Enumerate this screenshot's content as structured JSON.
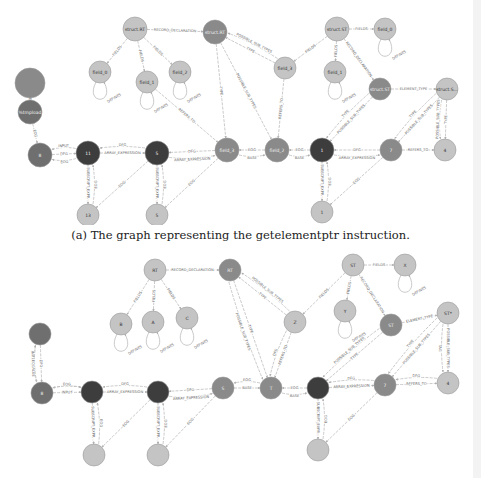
{
  "caption_a": "(a) The graph representing the getelementptr instruction.",
  "colors": {
    "dark": "#3d3d3d",
    "medium": "#8a8a8a",
    "light": "#c4c4c4",
    "mediumdark": "#6f6f6f",
    "edge": "#bdbdbd"
  },
  "graph_a": {
    "nodes": [
      {
        "id": "a_top",
        "label": "",
        "x": 30,
        "y": 83,
        "r": 15,
        "tone": "medium"
      },
      {
        "id": "a_tmp",
        "label": "%tmpload",
        "x": 30,
        "y": 112,
        "r": 12,
        "tone": "mediumdark"
      },
      {
        "id": "a_8",
        "label": "8",
        "x": 40,
        "y": 155,
        "r": 12,
        "tone": "mediumdark"
      },
      {
        "id": "a_11",
        "label": "11",
        "x": 88,
        "y": 153,
        "r": 12,
        "tone": "dark"
      },
      {
        "id": "a_13",
        "label": "13",
        "x": 88,
        "y": 215,
        "r": 11,
        "tone": "light"
      },
      {
        "id": "a_5",
        "label": "5",
        "x": 157,
        "y": 153,
        "r": 12,
        "tone": "dark"
      },
      {
        "id": "a_5b",
        "label": "5",
        "x": 157,
        "y": 215,
        "r": 11,
        "tone": "light"
      },
      {
        "id": "a_field3",
        "label": "field_3",
        "x": 227,
        "y": 150,
        "r": 12,
        "tone": "medium"
      },
      {
        "id": "a_field2b",
        "label": "field_2",
        "x": 277,
        "y": 150,
        "r": 12,
        "tone": "medium"
      },
      {
        "id": "a_1",
        "label": "1",
        "x": 322,
        "y": 150,
        "r": 12,
        "tone": "dark"
      },
      {
        "id": "a_1b",
        "label": "1",
        "x": 322,
        "y": 212,
        "r": 11,
        "tone": "light"
      },
      {
        "id": "a_7",
        "label": "7",
        "x": 391,
        "y": 150,
        "r": 11,
        "tone": "medium"
      },
      {
        "id": "a_4",
        "label": "4",
        "x": 445,
        "y": 150,
        "r": 11,
        "tone": "light"
      },
      {
        "id": "a_structRT",
        "label": "struct.RT",
        "x": 135,
        "y": 29,
        "r": 12,
        "tone": "light"
      },
      {
        "id": "a_structRT2",
        "label": "struct.RT",
        "x": 215,
        "y": 32,
        "r": 12,
        "tone": "medium"
      },
      {
        "id": "a_field0",
        "label": "field_0",
        "x": 100,
        "y": 72,
        "r": 11,
        "tone": "light"
      },
      {
        "id": "a_field1",
        "label": "field_1",
        "x": 147,
        "y": 82,
        "r": 11,
        "tone": "light"
      },
      {
        "id": "a_field2",
        "label": "field_2",
        "x": 180,
        "y": 72,
        "r": 11,
        "tone": "light"
      },
      {
        "id": "a_field3b",
        "label": "field_3",
        "x": 285,
        "y": 68,
        "r": 11,
        "tone": "light"
      },
      {
        "id": "a_structST",
        "label": "struct.ST",
        "x": 337,
        "y": 29,
        "r": 12,
        "tone": "light"
      },
      {
        "id": "a_field0b",
        "label": "field_0",
        "x": 385,
        "y": 29,
        "r": 11,
        "tone": "light"
      },
      {
        "id": "a_field1b",
        "label": "field_1",
        "x": 335,
        "y": 72,
        "r": 11,
        "tone": "light"
      },
      {
        "id": "a_structST2",
        "label": "struct.ST",
        "x": 380,
        "y": 89,
        "r": 11,
        "tone": "medium"
      },
      {
        "id": "a_structS",
        "label": "struct.S...",
        "x": 447,
        "y": 89,
        "r": 11,
        "tone": "light"
      }
    ],
    "edges": [
      {
        "from": "a_top",
        "to": "a_tmp",
        "label": "DEF"
      },
      {
        "from": "a_tmp",
        "to": "a_8",
        "label": "EOG"
      },
      {
        "from": "a_8",
        "to": "a_11",
        "label": "DFG"
      },
      {
        "from": "a_11",
        "to": "a_8",
        "label": "INPUT"
      },
      {
        "from": "a_11",
        "to": "a_8",
        "label": "EOG"
      },
      {
        "from": "a_11",
        "to": "a_5",
        "label": "ARRAY_EXPRESSION"
      },
      {
        "from": "a_5",
        "to": "a_11",
        "label": "DFG"
      },
      {
        "from": "a_11",
        "to": "a_13",
        "label": "SUBSCRIPT_EXPR..."
      },
      {
        "from": "a_13",
        "to": "a_11",
        "label": "EOG"
      },
      {
        "from": "a_5",
        "to": "a_13",
        "label": "EOG"
      },
      {
        "from": "a_5",
        "to": "a_5b",
        "label": "SUBSCRIPT_EXPR..."
      },
      {
        "from": "a_5b",
        "to": "a_5",
        "label": "EOG"
      },
      {
        "from": "a_field3",
        "to": "a_5",
        "label": "DFG"
      },
      {
        "from": "a_5",
        "to": "a_field3",
        "label": "ARRAY_EXPRESSION"
      },
      {
        "from": "a_field3",
        "to": "a_5b",
        "label": "EOG"
      },
      {
        "from": "a_field2b",
        "to": "a_field3",
        "label": "EOG"
      },
      {
        "from": "a_field3",
        "to": "a_field2b",
        "label": "BASE"
      },
      {
        "from": "a_1",
        "to": "a_field2b",
        "label": "EOG"
      },
      {
        "from": "a_field2b",
        "to": "a_1",
        "label": "BASE"
      },
      {
        "from": "a_1",
        "to": "a_1b",
        "label": "SUBSCRIPT_EXPR..."
      },
      {
        "from": "a_1b",
        "to": "a_1",
        "label": "EOG"
      },
      {
        "from": "a_7",
        "to": "a_1",
        "label": "DFG"
      },
      {
        "from": "a_1",
        "to": "a_7",
        "label": "ARRAY_EXPRESSION"
      },
      {
        "from": "a_7",
        "to": "a_1b",
        "label": "EOG"
      },
      {
        "from": "a_7",
        "to": "a_4",
        "label": "REFERS_TO"
      },
      {
        "from": "a_structRT",
        "to": "a_structRT2",
        "label": "RECORD_DECLARATION"
      },
      {
        "from": "a_structRT",
        "to": "a_field0",
        "label": "FIELDS"
      },
      {
        "from": "a_structRT",
        "to": "a_field1",
        "label": "FIELDS"
      },
      {
        "from": "a_structRT",
        "to": "a_field2",
        "label": "FIELDS"
      },
      {
        "from": "a_field0",
        "to": "a_field0",
        "label": "DEFINES"
      },
      {
        "from": "a_field1",
        "to": "a_field1",
        "label": "DEFINES"
      },
      {
        "from": "a_field2",
        "to": "a_field2",
        "label": "DEFINES"
      },
      {
        "from": "a_field1",
        "to": "a_field3",
        "label": "REFERS_TO"
      },
      {
        "from": "a_structRT2",
        "to": "a_field3",
        "label": "TYPE"
      },
      {
        "from": "a_field3b",
        "to": "a_structRT2",
        "label": "TYPE"
      },
      {
        "from": "a_field3b",
        "to": "a_structRT2",
        "label": "POSSIBLE_SUB_TYPES"
      },
      {
        "from": "a_structRT2",
        "to": "a_field2b",
        "label": "POSSIBLE_SUB_TYPES"
      },
      {
        "from": "a_field3b",
        "to": "a_field2b",
        "label": "REFERS_TO"
      },
      {
        "from": "a_structST",
        "to": "a_field0b",
        "label": "FIELDS"
      },
      {
        "from": "a_structST",
        "to": "a_field1b",
        "label": "FIELDS"
      },
      {
        "from": "a_structST",
        "to": "a_field3b",
        "label": "FIELDS"
      },
      {
        "from": "a_structST",
        "to": "a_structST2",
        "label": "RECORD_DECLARATION"
      },
      {
        "from": "a_field0b",
        "to": "a_field0b",
        "label": "DEFINES"
      },
      {
        "from": "a_field1b",
        "to": "a_field1b",
        "label": "DEFINES"
      },
      {
        "from": "a_structST2",
        "to": "a_structS",
        "label": "ELEMENT_TYPE"
      },
      {
        "from": "a_structST2",
        "to": "a_1",
        "label": "POSSIBLE_SUB_TYPES"
      },
      {
        "from": "a_structST2",
        "to": "a_1",
        "label": "TYPE"
      },
      {
        "from": "a_structS",
        "to": "a_7",
        "label": "POSSIBLE_SUB_TYPES"
      },
      {
        "from": "a_structS",
        "to": "a_7",
        "label": "TYPE"
      },
      {
        "from": "a_structS",
        "to": "a_4",
        "label": "TYPE"
      },
      {
        "from": "a_structS",
        "to": "a_4",
        "label": "POSSIBLE_SUB_TYPES"
      }
    ]
  },
  "graph_b": {
    "nodes": [
      {
        "id": "b_top",
        "label": "",
        "x": 40,
        "y": 334,
        "r": 11,
        "tone": "mediumdark"
      },
      {
        "id": "b_8",
        "label": "8",
        "x": 42,
        "y": 393,
        "r": 11,
        "tone": "mediumdark"
      },
      {
        "id": "b_11",
        "label": "",
        "x": 92,
        "y": 392,
        "r": 11,
        "tone": "dark"
      },
      {
        "id": "b_13",
        "label": "",
        "x": 94,
        "y": 455,
        "r": 11,
        "tone": "light"
      },
      {
        "id": "b_5",
        "label": "",
        "x": 158,
        "y": 392,
        "r": 11,
        "tone": "dark"
      },
      {
        "id": "b_5b",
        "label": "",
        "x": 158,
        "y": 455,
        "r": 11,
        "tone": "light"
      },
      {
        "id": "b_s",
        "label": "S",
        "x": 223,
        "y": 388,
        "r": 11,
        "tone": "medium"
      },
      {
        "id": "b_t",
        "label": "T",
        "x": 271,
        "y": 388,
        "r": 11,
        "tone": "medium"
      },
      {
        "id": "b_1",
        "label": "",
        "x": 318,
        "y": 388,
        "r": 11,
        "tone": "dark"
      },
      {
        "id": "b_1b",
        "label": "",
        "x": 318,
        "y": 450,
        "r": 11,
        "tone": "light"
      },
      {
        "id": "b_7",
        "label": "7",
        "x": 385,
        "y": 385,
        "r": 11,
        "tone": "medium"
      },
      {
        "id": "b_4",
        "label": "4",
        "x": 448,
        "y": 383,
        "r": 11,
        "tone": "light"
      },
      {
        "id": "b_RT",
        "label": "RT",
        "x": 155,
        "y": 270,
        "r": 11,
        "tone": "light"
      },
      {
        "id": "b_RT2",
        "label": "RT",
        "x": 230,
        "y": 270,
        "r": 11,
        "tone": "medium"
      },
      {
        "id": "b_B",
        "label": "B",
        "x": 121,
        "y": 324,
        "r": 11,
        "tone": "light"
      },
      {
        "id": "b_A",
        "label": "A",
        "x": 153,
        "y": 322,
        "r": 11,
        "tone": "light"
      },
      {
        "id": "b_C",
        "label": "C",
        "x": 187,
        "y": 318,
        "r": 11,
        "tone": "light"
      },
      {
        "id": "b_Z",
        "label": "Z",
        "x": 295,
        "y": 322,
        "r": 11,
        "tone": "light"
      },
      {
        "id": "b_ST",
        "label": "ST",
        "x": 353,
        "y": 265,
        "r": 11,
        "tone": "light"
      },
      {
        "id": "b_X",
        "label": "X",
        "x": 405,
        "y": 265,
        "r": 11,
        "tone": "light"
      },
      {
        "id": "b_Y",
        "label": "Y",
        "x": 345,
        "y": 311,
        "r": 11,
        "tone": "light"
      },
      {
        "id": "b_ST2",
        "label": "ST",
        "x": 391,
        "y": 325,
        "r": 11,
        "tone": "medium"
      },
      {
        "id": "b_STp",
        "label": "ST*",
        "x": 448,
        "y": 313,
        "r": 11,
        "tone": "light"
      }
    ],
    "edges": [
      {
        "from": "b_top",
        "to": "b_8",
        "label": "DFG"
      },
      {
        "from": "b_top",
        "to": "b_8",
        "label": "INITIAL_VALUE"
      },
      {
        "from": "b_8",
        "to": "b_top",
        "label": "EOG"
      },
      {
        "from": "b_8",
        "to": "b_11",
        "label": "INPUT"
      },
      {
        "from": "b_11",
        "to": "b_8",
        "label": "DFG"
      },
      {
        "from": "b_8",
        "to": "b_11",
        "label": "EOG"
      },
      {
        "from": "b_11",
        "to": "b_5",
        "label": "ARRAY_EXPRESSION"
      },
      {
        "from": "b_5",
        "to": "b_11",
        "label": "DFG"
      },
      {
        "from": "b_11",
        "to": "b_13",
        "label": "SUBSCRIPT_EXPR..."
      },
      {
        "from": "b_13",
        "to": "b_11",
        "label": "EOG"
      },
      {
        "from": "b_5",
        "to": "b_13",
        "label": "EOG"
      },
      {
        "from": "b_5",
        "to": "b_5b",
        "label": "SUBSCRIPT_EXPR..."
      },
      {
        "from": "b_5b",
        "to": "b_5",
        "label": "EOG"
      },
      {
        "from": "b_s",
        "to": "b_5",
        "label": "DFG"
      },
      {
        "from": "b_5",
        "to": "b_s",
        "label": "ARRAY_EXPRESSION"
      },
      {
        "from": "b_s",
        "to": "b_5b",
        "label": "EOG"
      },
      {
        "from": "b_s",
        "to": "b_t",
        "label": "BASE"
      },
      {
        "from": "b_t",
        "to": "b_s",
        "label": "EOG"
      },
      {
        "from": "b_1",
        "to": "b_t",
        "label": "EOG"
      },
      {
        "from": "b_t",
        "to": "b_1",
        "label": "BASE"
      },
      {
        "from": "b_1",
        "to": "b_1b",
        "label": "SUBSCRIPT_EXPR..."
      },
      {
        "from": "b_1b",
        "to": "b_1",
        "label": "EOG"
      },
      {
        "from": "b_1",
        "to": "b_7",
        "label": "ARRAY_EXPRESSION"
      },
      {
        "from": "b_7",
        "to": "b_1",
        "label": "DFG"
      },
      {
        "from": "b_7",
        "to": "b_1b",
        "label": "EOG"
      },
      {
        "from": "b_7",
        "to": "b_4",
        "label": "REFERS_TO"
      },
      {
        "from": "b_4",
        "to": "b_7",
        "label": "DFG"
      },
      {
        "from": "b_RT",
        "to": "b_RT2",
        "label": "RECORD_DECLARATION"
      },
      {
        "from": "b_RT",
        "to": "b_B",
        "label": "FIELDS"
      },
      {
        "from": "b_RT",
        "to": "b_A",
        "label": "FIELDS"
      },
      {
        "from": "b_RT",
        "to": "b_C",
        "label": "FIELDS"
      },
      {
        "from": "b_B",
        "to": "b_B",
        "label": "DEFINES"
      },
      {
        "from": "b_A",
        "to": "b_A",
        "label": "DEFINES"
      },
      {
        "from": "b_C",
        "to": "b_C",
        "label": "DEFINES"
      },
      {
        "from": "b_RT2",
        "to": "b_t",
        "label": "TYPE"
      },
      {
        "from": "b_Z",
        "to": "b_RT2",
        "label": "TYPE"
      },
      {
        "from": "b_Z",
        "to": "b_RT2",
        "label": "POSSIBLE_SUB_TYPES"
      },
      {
        "from": "b_RT2",
        "to": "b_t",
        "label": "POSSIBLE_SUB_TYPES"
      },
      {
        "from": "b_Z",
        "to": "b_t",
        "label": "REFERS_TO"
      },
      {
        "from": "b_Z",
        "to": "b_t",
        "label": "DFG"
      },
      {
        "from": "b_ST",
        "to": "b_X",
        "label": "FIELDS"
      },
      {
        "from": "b_ST",
        "to": "b_Y",
        "label": "FIELDS"
      },
      {
        "from": "b_ST",
        "to": "b_Z",
        "label": "FIELDS"
      },
      {
        "from": "b_ST",
        "to": "b_ST2",
        "label": "RECORD_DECLARATION"
      },
      {
        "from": "b_X",
        "to": "b_X",
        "label": "DEFINES"
      },
      {
        "from": "b_Y",
        "to": "b_Y",
        "label": "DEFINES"
      },
      {
        "from": "b_ST2",
        "to": "b_STp",
        "label": "ELEMENT_TYPE"
      },
      {
        "from": "b_ST2",
        "to": "b_1",
        "label": "TYPE"
      },
      {
        "from": "b_ST2",
        "to": "b_1",
        "label": "POSSIBLE_SUB_TYPES"
      },
      {
        "from": "b_STp",
        "to": "b_7",
        "label": "POSSIBLE_SUB_TYPES"
      },
      {
        "from": "b_STp",
        "to": "b_7",
        "label": "TYPE"
      },
      {
        "from": "b_STp",
        "to": "b_4",
        "label": "POSSIBLE_SUB_TYPES"
      },
      {
        "from": "b_STp",
        "to": "b_4",
        "label": "TAG"
      }
    ]
  }
}
